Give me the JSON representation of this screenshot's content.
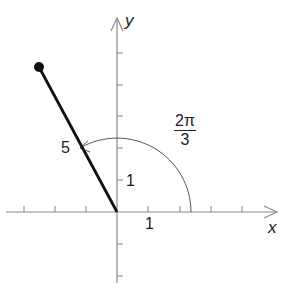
{
  "diagram": {
    "type": "polar-angle-vector",
    "axes": {
      "x_label": "x",
      "y_label": "y",
      "x_unit_label": "1",
      "y_unit_label": "1"
    },
    "vector": {
      "length_label": "5",
      "angle_label_numerator": "2π",
      "angle_label_denominator": "3",
      "angle_radians": "2π/3"
    },
    "colors": {
      "axis": "#8a8a8a",
      "vector": "#111111",
      "arc": "#555555",
      "text": "#222222"
    }
  }
}
